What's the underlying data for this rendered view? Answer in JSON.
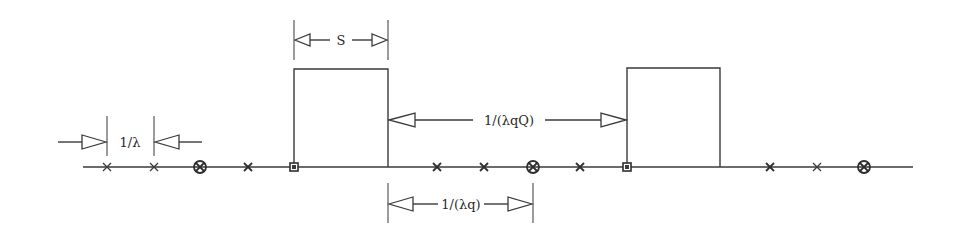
{
  "diagram": {
    "title": "",
    "labels": {
      "pulse_width": "S",
      "arrival_interval": "1/λ",
      "inter_pulse_interval": "1/(λqQ)",
      "selected_interval": "1/(λq)"
    },
    "timeline": {
      "markers": [
        {
          "type": "cross-small",
          "x": 107
        },
        {
          "type": "cross-small",
          "x": 154
        },
        {
          "type": "circle-cross",
          "x": 200
        },
        {
          "type": "cross-bold",
          "x": 248
        },
        {
          "type": "boxed-square",
          "x": 294
        },
        {
          "type": "cross-bold",
          "x": 437
        },
        {
          "type": "cross-bold",
          "x": 484
        },
        {
          "type": "circle-cross",
          "x": 533
        },
        {
          "type": "cross-bold",
          "x": 580
        },
        {
          "type": "boxed-square",
          "x": 627
        },
        {
          "type": "cross-bold",
          "x": 770
        },
        {
          "type": "cross-small",
          "x": 817
        },
        {
          "type": "circle-cross",
          "x": 864
        }
      ],
      "pulses": [
        {
          "start": 294,
          "end": 388
        },
        {
          "start": 627,
          "end": 720
        }
      ]
    },
    "colors": {
      "line": "#3a3a3a",
      "background": "#ffffff"
    }
  }
}
